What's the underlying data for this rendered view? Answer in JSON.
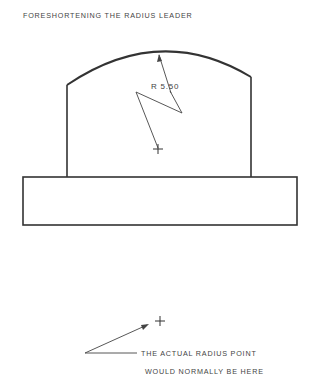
{
  "title": "FORESHORTENING THE RADIUS LEADER",
  "dimension": {
    "label": "R 5.50"
  },
  "note": {
    "line1": "THE ACTUAL RADIUS POINT",
    "line2": "WOULD NORMALLY BE HERE"
  },
  "colors": {
    "ink": "#333333",
    "background": "#ffffff"
  }
}
